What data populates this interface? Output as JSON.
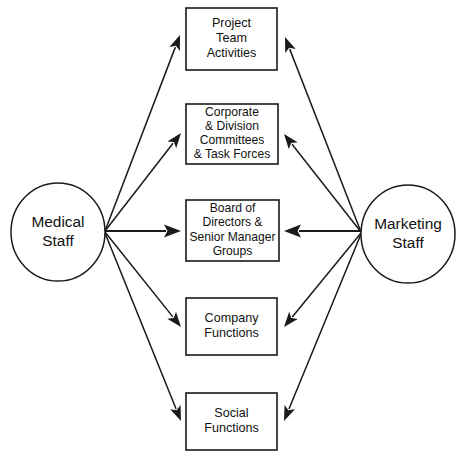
{
  "diagram": {
    "type": "interaction-diagram",
    "canvas": {
      "width": 463,
      "height": 456
    },
    "colors": {
      "stroke": "#1a1a1a",
      "fill": "#ffffff",
      "text": "#111111"
    },
    "sources": [
      {
        "id": "medical-staff",
        "label_lines": [
          "Medical",
          "Staff"
        ],
        "shape": "ellipse",
        "cx": 58,
        "cy": 232,
        "rx": 47,
        "ry": 49,
        "hub_x": 105,
        "hub_y": 231
      },
      {
        "id": "marketing-staff",
        "label_lines": [
          "Marketing",
          "Staff"
        ],
        "shape": "ellipse",
        "cx": 408,
        "cy": 234,
        "rx": 47,
        "ry": 49,
        "hub_x": 361,
        "hub_y": 232
      }
    ],
    "targets": [
      {
        "id": "project-team-activities",
        "label_lines": [
          "Project",
          "Team",
          "Activities"
        ],
        "shape": "rect",
        "x": 186,
        "y": 8,
        "width": 91,
        "height": 62,
        "compact": false
      },
      {
        "id": "corporate-division-committees",
        "label_lines": [
          "Corporate",
          "& Division",
          "Committees",
          "& Task Forces"
        ],
        "shape": "rect",
        "x": 186,
        "y": 104,
        "width": 92,
        "height": 60,
        "compact": true
      },
      {
        "id": "board-of-directors",
        "label_lines": [
          "Board of",
          "Directors &",
          "Senior Manager",
          "Groups"
        ],
        "shape": "rect",
        "x": 186,
        "y": 200,
        "width": 93,
        "height": 61,
        "compact": true
      },
      {
        "id": "company-functions",
        "label_lines": [
          "Company",
          "Functions"
        ],
        "shape": "rect",
        "x": 186,
        "y": 298,
        "width": 91,
        "height": 57,
        "compact": false
      },
      {
        "id": "social-functions",
        "label_lines": [
          "Social",
          "Functions"
        ],
        "shape": "rect",
        "x": 186,
        "y": 393,
        "width": 91,
        "height": 57,
        "compact": false
      }
    ],
    "edges": [
      {
        "id": "medical-to-project-team",
        "from": "medical-staff",
        "to": "project-team-activities",
        "x1": 105,
        "y1": 231,
        "x2": 180,
        "y2": 35,
        "thick": false
      },
      {
        "id": "medical-to-corporate-committees",
        "from": "medical-staff",
        "to": "corporate-division-committees",
        "x1": 105,
        "y1": 231,
        "x2": 181,
        "y2": 133,
        "thick": false
      },
      {
        "id": "medical-to-board-of-directors",
        "from": "medical-staff",
        "to": "board-of-directors",
        "x1": 105,
        "y1": 231,
        "x2": 181,
        "y2": 231,
        "thick": true
      },
      {
        "id": "medical-to-company-functions",
        "from": "medical-staff",
        "to": "company-functions",
        "x1": 105,
        "y1": 232,
        "x2": 181,
        "y2": 327,
        "thick": false
      },
      {
        "id": "medical-to-social-functions",
        "from": "medical-staff",
        "to": "social-functions",
        "x1": 105,
        "y1": 233,
        "x2": 181,
        "y2": 421,
        "thick": false
      },
      {
        "id": "marketing-to-project-team",
        "from": "marketing-staff",
        "to": "project-team-activities",
        "x1": 361,
        "y1": 232,
        "x2": 285,
        "y2": 37,
        "thick": false
      },
      {
        "id": "marketing-to-corporate-committees",
        "from": "marketing-staff",
        "to": "corporate-division-committees",
        "x1": 361,
        "y1": 232,
        "x2": 284,
        "y2": 134,
        "thick": false
      },
      {
        "id": "marketing-to-board-of-directors",
        "from": "marketing-staff",
        "to": "board-of-directors",
        "x1": 361,
        "y1": 231,
        "x2": 284,
        "y2": 231,
        "thick": true
      },
      {
        "id": "marketing-to-company-functions",
        "from": "marketing-staff",
        "to": "company-functions",
        "x1": 361,
        "y1": 233,
        "x2": 284,
        "y2": 327,
        "thick": false
      },
      {
        "id": "marketing-to-social-functions",
        "from": "marketing-staff",
        "to": "social-functions",
        "x1": 361,
        "y1": 234,
        "x2": 284,
        "y2": 421,
        "thick": false
      }
    ]
  }
}
